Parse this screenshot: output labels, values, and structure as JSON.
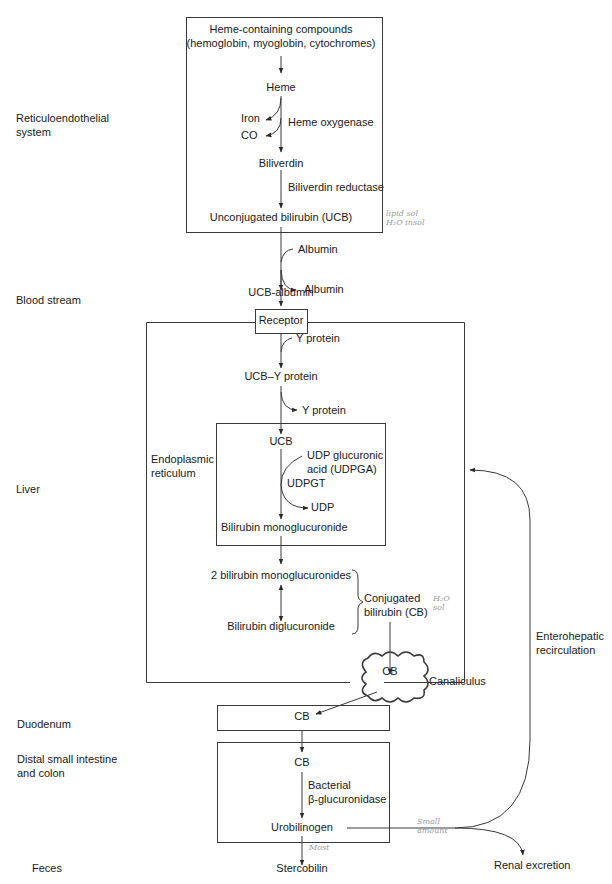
{
  "regions": {
    "res": [
      "Reticuloendothelial",
      "system"
    ],
    "blood": "Blood stream",
    "liver": "Liver",
    "duodenum": "Duodenum",
    "distal": [
      "Distal small intestine",
      "and colon"
    ],
    "feces": "Feces"
  },
  "res_box": {
    "heme_compounds": [
      "Heme-containing compounds",
      "(hemoglobin, myoglobin, cytochromes)"
    ],
    "heme": "Heme",
    "iron": "Iron",
    "co": "CO",
    "heme_oxygenase": "Heme oxygenase",
    "biliverdin": "Biliverdin",
    "biliverdin_reductase": "Biliverdin reductase",
    "ucb": "Unconjugated bilirubin (UCB)"
  },
  "blood": {
    "albumin_in": "Albumin",
    "ucb_albumin": "UCB-albumin",
    "albumin_out": "Albumin"
  },
  "liver": {
    "receptor": "Receptor",
    "y_protein_in": "Y protein",
    "ucb_y_protein": "UCB–Y protein",
    "y_protein_out": "Y protein",
    "er_label": [
      "Endoplasmic",
      "reticulum"
    ],
    "er": {
      "ucb": "UCB",
      "udpga": [
        "UDP glucuronic",
        "acid (UDPGA)"
      ],
      "udpgt": "UDPGT",
      "udp": "UDP",
      "monoglucuronide": "Bilirubin monoglucuronide"
    },
    "two_mono": "2 bilirubin monoglucuronides",
    "diglucuronide": "Bilirubin diglucuronide",
    "conjugated": [
      "Conjugated",
      "bilirubin (CB)"
    ],
    "canaliculus_cb": "CB",
    "canaliculus": "Canaliculus"
  },
  "gut": {
    "duodenum_cb": "CB",
    "distal_cb": "CB",
    "bacterial": [
      "Bacterial",
      "β-glucuronidase"
    ],
    "urobilinogen": "Urobilinogen",
    "stercobilin": "Stercobilin",
    "renal": "Renal excretion",
    "enterohepatic": [
      "Enterohepatic",
      "recirculation"
    ]
  },
  "annotations": {
    "lipid": [
      "lipid  sol",
      "H₂O  insol"
    ],
    "h2o": [
      "H₂O",
      "sol"
    ],
    "small_amount": [
      "Small",
      "amount"
    ],
    "most": "Most"
  },
  "colors": {
    "line": "#3a3a3a",
    "text": "#1a1a1a",
    "handwriting": "#9a9a9a"
  }
}
